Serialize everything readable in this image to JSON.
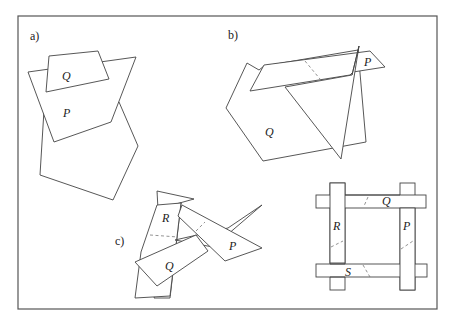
{
  "figure": {
    "panels": [
      {
        "id": "a",
        "label": "a)",
        "pieces": [
          "Q",
          "P"
        ]
      },
      {
        "id": "b",
        "label": "b)",
        "pieces": [
          "P",
          "Q"
        ]
      },
      {
        "id": "c",
        "label": "c)",
        "pieces": [
          "R",
          "P",
          "Q"
        ]
      },
      {
        "id": "d",
        "label": "",
        "pieces": [
          "Q",
          "R",
          "P",
          "S"
        ]
      }
    ],
    "colors": {
      "stroke": "#444444",
      "frame": "#555555",
      "background": "#ffffff"
    }
  }
}
